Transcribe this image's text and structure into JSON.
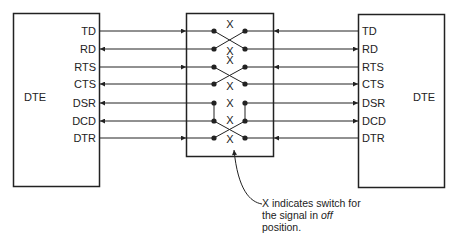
{
  "diagram": {
    "left_device": {
      "label": "DTE"
    },
    "right_device": {
      "label": "DTE"
    },
    "signals": [
      {
        "name": "TD",
        "left_dir": "out",
        "right_dir": "out",
        "switch": "X"
      },
      {
        "name": "RD",
        "left_dir": "in",
        "right_dir": "in",
        "switch": "X"
      },
      {
        "name": "RTS",
        "left_dir": "out",
        "right_dir": "out",
        "switch": "X"
      },
      {
        "name": "CTS",
        "left_dir": "in",
        "right_dir": "in",
        "switch": "X"
      },
      {
        "name": "DSR",
        "left_dir": "in",
        "right_dir": "in",
        "switch": "X"
      },
      {
        "name": "DCD",
        "left_dir": "in",
        "right_dir": "in",
        "switch": "X"
      },
      {
        "name": "DTR",
        "left_dir": "out",
        "right_dir": "out",
        "switch": "X"
      }
    ],
    "crossings": [
      {
        "from": "TD",
        "to": "RD",
        "type": "cross"
      },
      {
        "from": "RTS",
        "to": "CTS",
        "type": "cross"
      },
      {
        "from": "DSR",
        "to": "DCD",
        "type": "jumper-both-sides"
      },
      {
        "from": "DCD",
        "to": "DTR",
        "type": "cross"
      }
    ],
    "note": {
      "line1": "X indicates switch for",
      "line2_prefix": "the signal in ",
      "line2_italic": "off",
      "line3": "position."
    },
    "colors": {
      "line": "#222222",
      "background": "#ffffff"
    }
  }
}
